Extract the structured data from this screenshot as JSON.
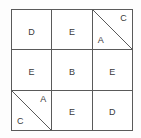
{
  "figure": {
    "name": "three-by-three-letter-grid",
    "rows": 3,
    "columns": 3,
    "colors": {
      "background": "#fdfdfd",
      "cell_fill": "#ffffff",
      "grid_line": "#5a5a5a",
      "diagonal_line": "#5a5a5a",
      "text": "#3a3a3a"
    }
  },
  "cells": [
    {
      "id": "cell-r1c1",
      "row": 1,
      "col": 1,
      "type": "plain",
      "label": "D"
    },
    {
      "id": "cell-r1c2",
      "row": 1,
      "col": 2,
      "type": "plain",
      "label": "E"
    },
    {
      "id": "cell-r1c3",
      "row": 1,
      "col": 3,
      "type": "split",
      "diagonal": "top-left-to-bottom-right",
      "lower_left_label": "A",
      "upper_right_label": "C"
    },
    {
      "id": "cell-r2c1",
      "row": 2,
      "col": 1,
      "type": "plain",
      "label": "E"
    },
    {
      "id": "cell-r2c2",
      "row": 2,
      "col": 2,
      "type": "plain",
      "label": "B"
    },
    {
      "id": "cell-r2c3",
      "row": 2,
      "col": 3,
      "type": "plain",
      "label": "E"
    },
    {
      "id": "cell-r3c1",
      "row": 3,
      "col": 1,
      "type": "split",
      "diagonal": "top-left-to-bottom-right",
      "lower_left_label": "C",
      "upper_right_label": "A"
    },
    {
      "id": "cell-r3c2",
      "row": 3,
      "col": 2,
      "type": "plain",
      "label": "E"
    },
    {
      "id": "cell-r3c3",
      "row": 3,
      "col": 3,
      "type": "plain",
      "label": "D"
    }
  ]
}
